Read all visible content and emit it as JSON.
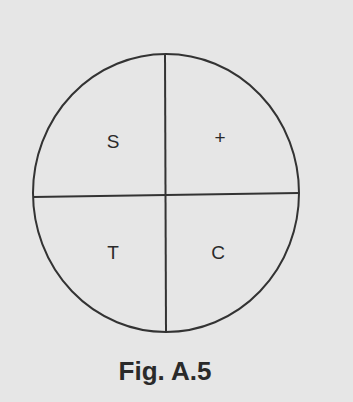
{
  "diagram": {
    "type": "quadrant-circle",
    "quadrants": [
      {
        "position": "top-left",
        "label": "S"
      },
      {
        "position": "top-right",
        "label": "+"
      },
      {
        "position": "bottom-left",
        "label": "T"
      },
      {
        "position": "bottom-right",
        "label": "C"
      }
    ],
    "caption": "Fig. A.5"
  }
}
